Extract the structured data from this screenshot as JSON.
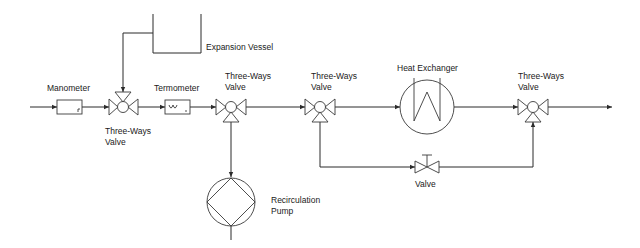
{
  "diagram": {
    "type": "process-flow",
    "components": {
      "manometer": {
        "label": "Manometer"
      },
      "three_way_valve_1": {
        "label_line1": "Three-Ways",
        "label_line2": "Valve"
      },
      "expansion_vessel": {
        "label": "Expansion Vessel"
      },
      "termometer": {
        "label": "Termometer"
      },
      "three_way_valve_2": {
        "label_line1": "Three-Ways",
        "label_line2": "Valve"
      },
      "recirculation_pump": {
        "label_line1": "Recirculation",
        "label_line2": "Pump"
      },
      "three_way_valve_3": {
        "label_line1": "Three-Ways",
        "label_line2": "Valve"
      },
      "heat_exchanger": {
        "label": "Heat Exchanger"
      },
      "valve": {
        "label": "Valve"
      },
      "three_way_valve_4": {
        "label_line1": "Three-Ways",
        "label_line2": "Valve"
      }
    },
    "colors": {
      "line": "#2b2b2b",
      "background": "#ffffff",
      "text": "#1a1a1a"
    }
  }
}
